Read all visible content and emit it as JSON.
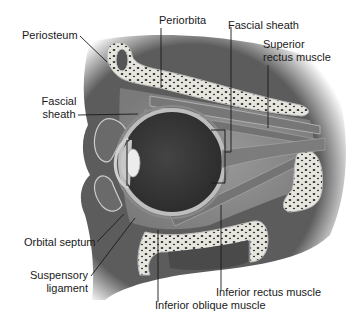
{
  "figure": {
    "colors": {
      "background": "#ffffff",
      "soft_tissue": "#6e6e6e",
      "orbital_fat": "#8c8c8c",
      "bone": "#e4e4dc",
      "bone_spots": "#2a2a2a",
      "eyeball_interior": "#3a3a3a",
      "sclera": "#b8b8b8",
      "lens": "#e8e8e8",
      "leader_line": "#1a1a1a",
      "label_text": "#1a1a1a"
    }
  },
  "labels": {
    "periosteum": "Periosteum",
    "periorbita": "Periorbita",
    "fascial_sheath_top": "Fascial sheath",
    "superior_rectus_line1": "Superior",
    "superior_rectus_line2": "rectus muscle",
    "fascial_sheath_left_line1": "Fascial",
    "fascial_sheath_left_line2": "sheath",
    "orbital_septum": "Orbital septum",
    "suspensory_line1": "Suspensory",
    "suspensory_line2": "ligament",
    "inferior_rectus": "Inferior rectus muscle",
    "inferior_oblique": "Inferior oblique muscle"
  }
}
